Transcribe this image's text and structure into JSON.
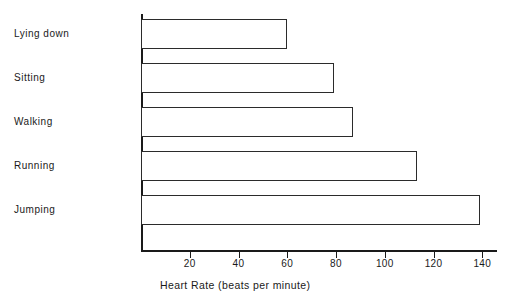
{
  "chart_data": {
    "type": "bar",
    "orientation": "horizontal",
    "title": "",
    "xlabel": "Heart Rate (beats per minute)",
    "ylabel": "",
    "categories": [
      "Lying down",
      "Sitting",
      "Walking",
      "Running",
      "Jumping"
    ],
    "values": [
      60,
      79,
      87,
      113,
      139
    ],
    "xlim": [
      0,
      146
    ],
    "xticks": [
      20,
      40,
      60,
      80,
      100,
      120,
      140
    ],
    "xtick_labels": [
      "20",
      "40",
      "60",
      "80",
      "100",
      "120",
      "140"
    ],
    "grid": false,
    "legend": null,
    "series": [
      {
        "name": "Heart Rate",
        "values": [
          60,
          79,
          87,
          113,
          139
        ]
      }
    ],
    "colors": {
      "bar_fill": "#ffffff",
      "bar_stroke": "#2b2b2b",
      "axis": "#1a1a1a",
      "text": "#1a1a1a",
      "background": "#ffffff"
    }
  }
}
